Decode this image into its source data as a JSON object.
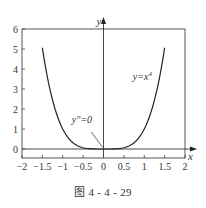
{
  "chart_data": {
    "type": "line",
    "title": "",
    "caption": "图 4 - 4 - 29",
    "xlabel": "x",
    "ylabel": "y",
    "xlim": [
      -2,
      2
    ],
    "ylim": [
      -0.45,
      6
    ],
    "xticks": [
      -2,
      -1.5,
      -1,
      -0.5,
      0,
      0.5,
      1,
      1.5,
      2
    ],
    "xtick_labels": [
      "−2",
      "−1.5",
      "−1",
      "−0.5",
      "0",
      "0.5",
      "1",
      "1.5",
      "2"
    ],
    "yticks": [
      0,
      1,
      2,
      3,
      4,
      5,
      6
    ],
    "ytick_labels": [
      "0",
      "1",
      "2",
      "3",
      "4",
      "5",
      "6"
    ],
    "grid": false,
    "series": [
      {
        "name": "y=x^4",
        "function": "x^4",
        "x_range": [
          -1.5,
          1.5
        ],
        "x": [
          -1.5,
          -1.25,
          -1.0,
          -0.75,
          -0.5,
          -0.25,
          0,
          0.25,
          0.5,
          0.75,
          1.0,
          1.25,
          1.5
        ],
        "y": [
          5.0625,
          2.4414,
          1.0,
          0.3164,
          0.0625,
          0.0039,
          0,
          0.0039,
          0.0625,
          0.3164,
          1.0,
          2.4414,
          5.0625
        ],
        "color": "#222222"
      }
    ],
    "annotations": [
      {
        "text": "y=x⁴",
        "x": 0.75,
        "y": 3.4
      },
      {
        "text": "y″=0",
        "x": -0.45,
        "y": 1.0,
        "arrow_to": [
          0,
          0
        ]
      }
    ],
    "legend": null
  },
  "labels": {
    "curve": "y=x",
    "curve_exp": "4",
    "inflection": "y″=0",
    "x_axis": "x",
    "y_axis": "y"
  }
}
